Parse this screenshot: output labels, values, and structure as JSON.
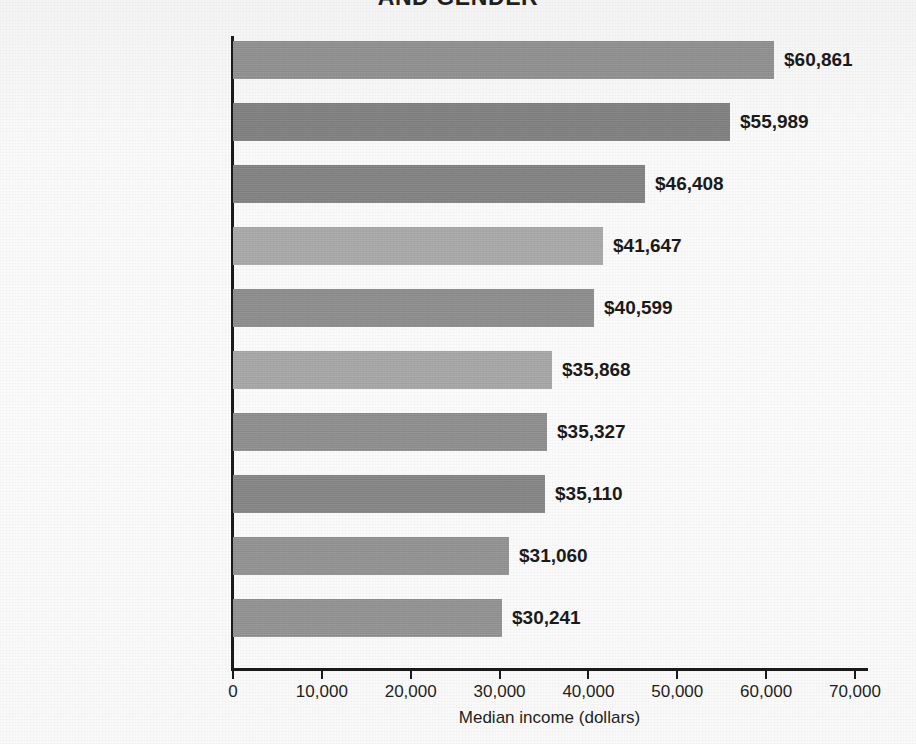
{
  "chart_data": {
    "type": "bar",
    "orientation": "horizontal",
    "title": "AND GENDER",
    "xlabel": "Median income (dollars)",
    "ylabel": "",
    "xlim": [
      0,
      72000
    ],
    "xticks": [
      "0",
      "10,000",
      "20,000",
      "30,000",
      "40,000",
      "50,000",
      "60,000",
      "70,000"
    ],
    "xtick_values": [
      0,
      10000,
      20000,
      30000,
      40000,
      50000,
      60000,
      70000
    ],
    "grid": false,
    "legend": null,
    "categories": [
      "Asian men",
      "White men",
      "Asian women",
      "White women",
      "Black men",
      "Native American and Alaska Native men",
      "Black women",
      "Hispanic men",
      "Native American and Alaska Native women",
      "Hispanic women"
    ],
    "values": [
      60861,
      55989,
      46408,
      41647,
      40599,
      35868,
      35327,
      35110,
      31060,
      30241
    ],
    "value_labels": [
      "$60,861",
      "$55,989",
      "$46,408",
      "$41,647",
      "$40,599",
      "$35,868",
      "$35,327",
      "$35,110",
      "$31,060",
      "$30,241"
    ],
    "bars": [
      {
        "label": "Asian men",
        "label_lines": [
          "Asian men"
        ],
        "value": 60861,
        "value_label": "$60,861",
        "color": "#8d8d8d"
      },
      {
        "label": "White men",
        "label_lines": [
          "White men"
        ],
        "value": 55989,
        "value_label": "$55,989",
        "color": "#7d7d7d"
      },
      {
        "label": "Asian women",
        "label_lines": [
          "Asian women"
        ],
        "value": 46408,
        "value_label": "$46,408",
        "color": "#7f7f7f"
      },
      {
        "label": "White women",
        "label_lines": [
          "White women"
        ],
        "value": 41647,
        "value_label": "$41,647",
        "color": "#a6a6a6"
      },
      {
        "label": "Black men",
        "label_lines": [
          "Black men"
        ],
        "value": 40599,
        "value_label": "$40,599",
        "color": "#8a8a8a"
      },
      {
        "label": "Native American and Alaska Native men",
        "label_lines": [
          "Native American and",
          "Alaska Native men"
        ],
        "value": 35868,
        "value_label": "$35,868",
        "color": "#a4a4a4"
      },
      {
        "label": "Black women",
        "label_lines": [
          "Black women"
        ],
        "value": 35327,
        "value_label": "$35,327",
        "color": "#8b8b8b"
      },
      {
        "label": "Hispanic men",
        "label_lines": [
          "Hispanic men"
        ],
        "value": 35110,
        "value_label": "$35,110",
        "color": "#828282"
      },
      {
        "label": "Native American and Alaska Native women",
        "label_lines": [
          "Native American and",
          "Alaska Native women"
        ],
        "value": 31060,
        "value_label": "$31,060",
        "color": "#8f8f8f"
      },
      {
        "label": "Hispanic women",
        "label_lines": [
          "Hispanic women"
        ],
        "value": 30241,
        "value_label": "$30,241",
        "color": "#8f8f8f"
      }
    ]
  },
  "colors": {
    "axis": "#1b1b1b",
    "text": "#231f20",
    "paper": "#fbfbfb"
  }
}
